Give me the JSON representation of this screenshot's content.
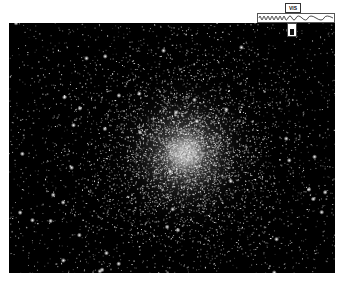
{
  "image": {
    "subject": "globular star cluster",
    "background_color": "#000000",
    "page_background": "#ffffff"
  },
  "band_icon": {
    "label": "VIS",
    "icon": "electromagnetic-spectrum-icon"
  }
}
